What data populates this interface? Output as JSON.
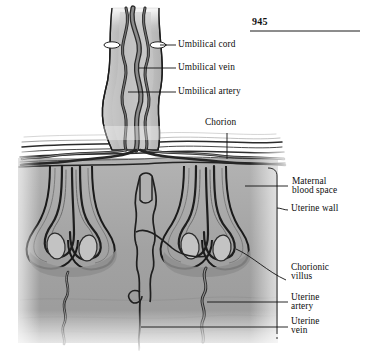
{
  "page": {
    "number": "945",
    "rule": true
  },
  "figure": {
    "colors": {
      "tissue_fill": "#a5a5a5",
      "tissue_fill_light": "#bdbdbd",
      "tissue_fill_dark": "#8d8d8d",
      "vessel_dark": "#3a3a3a",
      "vessel_mid": "#6f6f6f",
      "outline": "#1f1f1f",
      "paper": "#ffffff",
      "leader": "#141414"
    }
  },
  "labels": [
    {
      "id": "umbilical-cord",
      "text": "Umbilical cord",
      "line1": "Umbilical cord",
      "line2": ""
    },
    {
      "id": "umbilical-vein",
      "text": "Umbilical vein",
      "line1": "Umbilical vein",
      "line2": ""
    },
    {
      "id": "umbilical-artery",
      "text": "Umbilical artery",
      "line1": "Umbilical artery",
      "line2": ""
    },
    {
      "id": "chorion",
      "text": "Chorion",
      "line1": "Chorion",
      "line2": ""
    },
    {
      "id": "maternal-blood-space",
      "text": "Maternal blood space",
      "line1": "Maternal",
      "line2": "blood space"
    },
    {
      "id": "uterine-wall",
      "text": "Uterine wall",
      "line1": "Uterine wall",
      "line2": ""
    },
    {
      "id": "chorionic-villus",
      "text": "Chorionic villus",
      "line1": "Chorionic",
      "line2": "villus"
    },
    {
      "id": "uterine-artery",
      "text": "Uterine artery",
      "line1": "Uterine",
      "line2": "artery"
    },
    {
      "id": "uterine-vein",
      "text": "Uterine vein",
      "line1": "Uterine",
      "line2": "vein"
    }
  ]
}
